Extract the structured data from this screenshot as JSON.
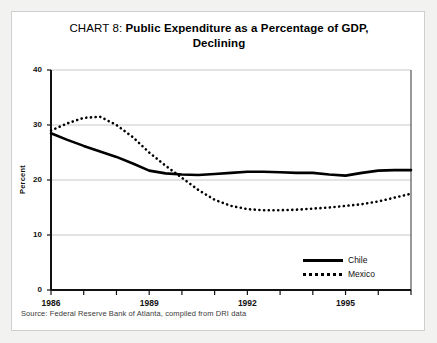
{
  "title": {
    "prefix": "CHART 8: ",
    "main_line1": "Public Expenditure as a Percentage of GDP,",
    "main_line2": "Declining"
  },
  "source": "Source: Federal Reserve Bank of Atlanta, compiled from DRI data",
  "legend": {
    "position": "bottom-right",
    "items": [
      {
        "label": "Chile",
        "style": "solid"
      },
      {
        "label": "Mexico",
        "style": "dotted"
      }
    ]
  },
  "colors": {
    "series": "#000000",
    "gridline": "#c8c8c8",
    "axis": "#111111",
    "card_background": "#ffffff",
    "page_background": "#f2f2f0",
    "card_border": "#cfcfcf"
  },
  "chart_data": {
    "type": "line",
    "title": "CHART 8: Public Expenditure as a Percentage of GDP, Declining",
    "xlabel": "",
    "ylabel": "Percent",
    "xlim": [
      1986,
      1997
    ],
    "ylim": [
      0,
      40
    ],
    "yticks": [
      0,
      10,
      20,
      30,
      40
    ],
    "ytick_labels": [
      "0",
      "10",
      "20",
      "30",
      "40"
    ],
    "xticks": [
      1986,
      1987,
      1988,
      1989,
      1990,
      1991,
      1992,
      1993,
      1994,
      1995,
      1996,
      1997
    ],
    "xtick_labels_shown": [
      "1986",
      "1989",
      "1992",
      "1995"
    ],
    "xtick_labels_shown_at": [
      1986,
      1989,
      1992,
      1995
    ],
    "grid": true,
    "grid_axis": "y",
    "x": [
      1986,
      1986.5,
      1987,
      1987.5,
      1988,
      1988.5,
      1989,
      1989.5,
      1990,
      1990.5,
      1991,
      1991.5,
      1992,
      1992.5,
      1993,
      1993.5,
      1994,
      1994.5,
      1995,
      1995.5,
      1996,
      1996.5,
      1997
    ],
    "series": [
      {
        "name": "Chile",
        "style": "solid",
        "values": [
          28.5,
          27.3,
          26.2,
          25.2,
          24.2,
          23.0,
          21.7,
          21.2,
          21.0,
          20.9,
          21.1,
          21.3,
          21.5,
          21.5,
          21.4,
          21.3,
          21.3,
          21.0,
          20.8,
          21.3,
          21.7,
          21.8,
          21.8
        ]
      },
      {
        "name": "Mexico",
        "style": "dotted",
        "values": [
          29.0,
          30.3,
          31.3,
          31.5,
          30.0,
          27.8,
          25.0,
          22.6,
          20.4,
          18.2,
          16.4,
          15.3,
          14.7,
          14.5,
          14.5,
          14.6,
          14.8,
          15.0,
          15.3,
          15.6,
          16.1,
          16.8,
          17.5
        ]
      }
    ]
  }
}
